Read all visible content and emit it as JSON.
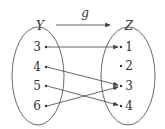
{
  "diagram": {
    "type": "mapping",
    "function_label": "g",
    "domain_set": {
      "label": "Y",
      "elements": [
        "3",
        "4",
        "5",
        "6"
      ]
    },
    "codomain_set": {
      "label": "Z",
      "elements": [
        "1",
        "2",
        "3",
        "4"
      ]
    },
    "mappings": [
      {
        "from": "3",
        "to": "1"
      },
      {
        "from": "4",
        "to": "3"
      },
      {
        "from": "5",
        "to": "4"
      },
      {
        "from": "6",
        "to": "3"
      }
    ],
    "colors": {
      "stroke": "#444444",
      "text": "#333333"
    }
  }
}
